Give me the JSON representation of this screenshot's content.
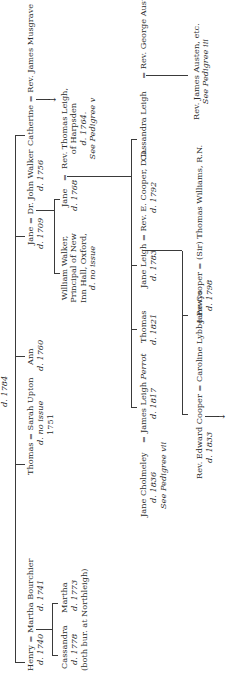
{
  "title_fragment": {
    "died": "d. 1784"
  },
  "generation1": {
    "henry": {
      "name": "Henry",
      "spouse_sep": "=",
      "spouse": "Martha Bourchier",
      "died": "d. 1740",
      "spouse_died": "d. 1741"
    },
    "thomas": {
      "name": "Thomas",
      "spouse_sep": "=",
      "spouse": "Sarah Upton",
      "died": "d. no issue",
      "year": "1751"
    },
    "ann": {
      "name": "Ann",
      "died": "d. 1760"
    },
    "jane": {
      "name": "Jane",
      "spouse_sep": "=",
      "spouse": "Dr. John Walker",
      "died": "d. 1709",
      "spouse_died": "d. 1756"
    },
    "catherine": {
      "name": "Catherine",
      "spouse_sep": "=",
      "spouse": "Rev. James Musgrave"
    }
  },
  "generation2": {
    "cassandra": {
      "name": "Cassandra",
      "died": "d. 1778",
      "note": "(both bur. at Northleigh)"
    },
    "martha": {
      "name": "Martha",
      "died": "d. 1773"
    },
    "william_walker": {
      "lines": [
        "William Walker,",
        "Principal of New",
        "Inn Hall, Oxford,",
        "d. no issue"
      ]
    },
    "jane_walker": {
      "name": "Jane",
      "died": "d. 1768",
      "spouse_sep": "="
    },
    "thomas_leigh": {
      "lines": [
        "Rev. Thomas Leigh,",
        "of Harpsden",
        "d. 1764.",
        "See Pedigree v"
      ]
    }
  },
  "generation3": {
    "james_leigh_perrot": {
      "name": "James Leigh",
      "name_italic": "Perrot",
      "died": "d. 1817"
    },
    "jane_cholmeley": {
      "name": "Jane Cholmeley",
      "spouse_sep": "=",
      "died": "d. 1836",
      "ref": "See Pedigree vii"
    },
    "thomas": {
      "name": "Thomas",
      "died": "d. 1821"
    },
    "jane_leigh": {
      "name": "Jane Leigh",
      "spouse_sep": "=",
      "spouse": "Rev. E. Cooper, D.D.",
      "died": "d. 1783",
      "spouse_died": "d. 1792"
    },
    "cassandra_leigh": {
      "name": "Cassandra Leigh",
      "spouse_sep": "=",
      "spouse": "Rev. George Austen"
    }
  },
  "generation4": {
    "edward_cooper": {
      "name": "Rev. Edward Cooper",
      "spouse_sep": "=",
      "spouse": "Caroline Lybbe Powys",
      "died": "d. 1833"
    },
    "jane_cooper": {
      "name": "Jane Cooper",
      "spouse_sep": "=",
      "spouse": "(Sir) Thomas Williams, R.N.",
      "died": "d. 1798"
    },
    "james_austen": {
      "lines": [
        "Rev. James Austen, etc.",
        "See Pedigree iii"
      ]
    }
  },
  "icons": {
    "arrow": "→"
  }
}
